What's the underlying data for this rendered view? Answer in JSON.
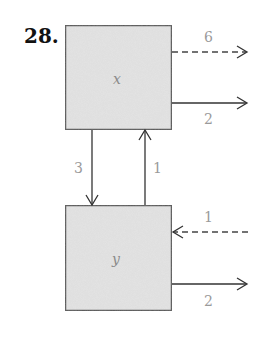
{
  "problem": {
    "number": "28."
  },
  "colors": {
    "box_fill": "#e4e4e4",
    "box_border": "#555555",
    "arrow": "#333333",
    "label": "#9a9a9a",
    "number": "#111111"
  },
  "boxes": [
    {
      "id": "x",
      "label": "x"
    },
    {
      "id": "y",
      "label": "y"
    }
  ],
  "flows": [
    {
      "id": "x-out-dashed",
      "from": "x",
      "to": "outside",
      "style": "dashed",
      "label": "6"
    },
    {
      "id": "x-out-solid",
      "from": "x",
      "to": "outside",
      "style": "solid",
      "label": "2"
    },
    {
      "id": "x-to-y",
      "from": "x",
      "to": "y",
      "style": "solid",
      "label": "3"
    },
    {
      "id": "y-to-x",
      "from": "y",
      "to": "x",
      "style": "solid",
      "label": "1"
    },
    {
      "id": "y-in-dashed",
      "from": "outside",
      "to": "y",
      "style": "dashed",
      "label": "1"
    },
    {
      "id": "y-out-solid",
      "from": "y",
      "to": "outside",
      "style": "solid",
      "label": "2"
    }
  ]
}
